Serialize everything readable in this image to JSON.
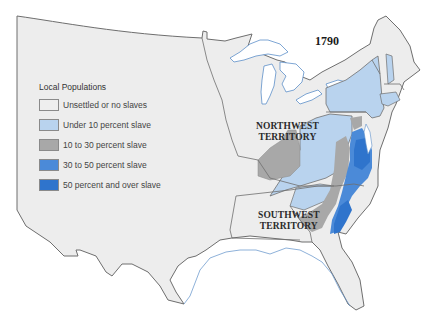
{
  "map": {
    "year": "1790",
    "colors": {
      "background": "#ffffff",
      "land": "#ededed",
      "border": "#6e6e6e",
      "water": "#ffffff",
      "coastline": "#5d8fc9"
    },
    "territories": [
      {
        "id": "northwest",
        "line1": "NORTHWEST",
        "line2": "TERRITORY"
      },
      {
        "id": "southwest",
        "line1": "SOUTHWEST",
        "line2": "TERRITORY"
      }
    ],
    "legend": {
      "title": "Local Populations",
      "items": [
        {
          "label": "Unsettled or no slaves",
          "color": "#eeeeee"
        },
        {
          "label": "Under 10 percent slave",
          "color": "#b9d3ee"
        },
        {
          "label": "10 to 30 percent slave",
          "color": "#a8a8a8"
        },
        {
          "label": "30 to 50 percent slave",
          "color": "#4b8ad8"
        },
        {
          "label": "50 percent and over slave",
          "color": "#2f74cc"
        }
      ]
    }
  }
}
